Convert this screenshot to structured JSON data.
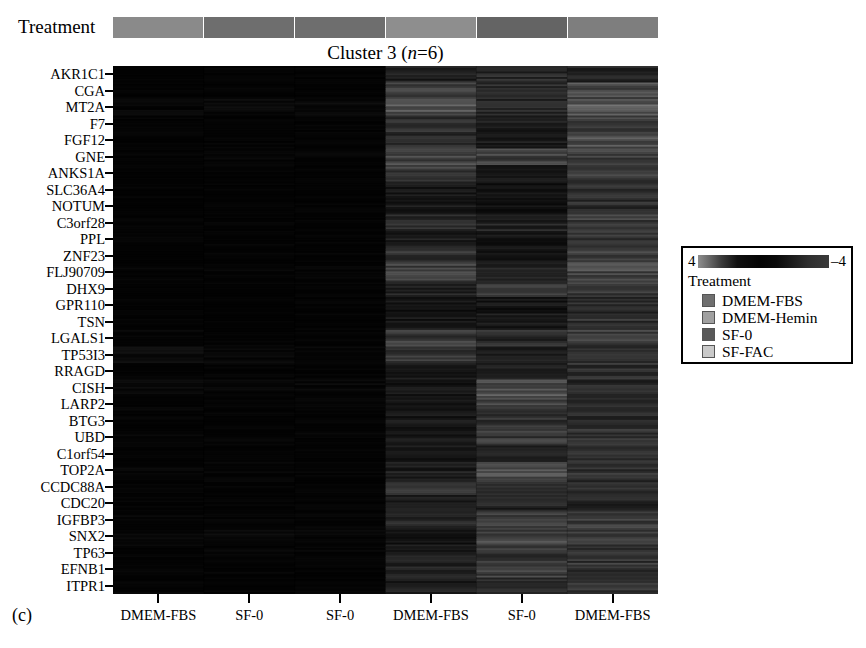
{
  "figure": {
    "panel_letter": "(c)",
    "title_prefix": "Cluster 3 (",
    "title_italic": "n",
    "title_suffix": "=6)",
    "treatment_axis_label": "Treatment"
  },
  "legend": {
    "heading": "Treatment",
    "scale_max": "4",
    "scale_min": "–4",
    "colorbar_colors": [
      "#8e8e8e",
      "#3a3a3a",
      "#040404",
      "#1c1c1c",
      "#3a3a3a"
    ],
    "items": [
      {
        "label": "DMEM-FBS",
        "color": "#6f6f6f"
      },
      {
        "label": "DMEM-Hemin",
        "color": "#a0a0a0"
      },
      {
        "label": "SF-0",
        "color": "#595959"
      },
      {
        "label": "SF-FAC",
        "color": "#c9c9c9"
      }
    ]
  },
  "treatment_strip": {
    "segments": [
      {
        "label": "DMEM-FBS",
        "color": "#8a8a8a"
      },
      {
        "label": "SF-0",
        "color": "#6e6e6e"
      },
      {
        "label": "SF-0",
        "color": "#6e6e6e"
      },
      {
        "label": "DMEM-FBS",
        "color": "#8e8e8e"
      },
      {
        "label": "SF-0",
        "color": "#646464"
      },
      {
        "label": "DMEM-FBS",
        "color": "#7e7e7e"
      }
    ]
  },
  "columns": {
    "labels": [
      "DMEM-FBS",
      "SF-0",
      "SF-0",
      "DMEM-FBS",
      "SF-0",
      "DMEM-FBS"
    ],
    "count": 6
  },
  "rows": {
    "genes": [
      "AKR1C1",
      "CGA",
      "MT2A",
      "F7",
      "FGF12",
      "GNE",
      "ANKS1A",
      "SLC36A4",
      "NOTUM",
      "C3orf28",
      "PPL",
      "ZNF23",
      "FLJ90709",
      "DHX9",
      "GPR110",
      "TSN",
      "LGALS1",
      "TP53I3",
      "RRAGD",
      "CISH",
      "LARP2",
      "BTG3",
      "UBD",
      "C1orf54",
      "TOP2A",
      "CCDC88A",
      "CDC20",
      "IGFBP3",
      "SNX2",
      "TP63",
      "EFNB1",
      "ITPR1"
    ],
    "count": 32
  },
  "chart_data": {
    "type": "heatmap",
    "title": "Cluster 3 (n=6)",
    "xlabel": "",
    "ylabel": "",
    "zlim": [
      -4,
      4
    ],
    "colormap": "grayscale-dark",
    "grid": false,
    "legend_position": "right",
    "x_categories": [
      "DMEM-FBS",
      "SF-0",
      "SF-0",
      "DMEM-FBS",
      "SF-0",
      "DMEM-FBS"
    ],
    "y_categories": [
      "AKR1C1",
      "CGA",
      "MT2A",
      "F7",
      "FGF12",
      "GNE",
      "ANKS1A",
      "SLC36A4",
      "NOTUM",
      "C3orf28",
      "PPL",
      "ZNF23",
      "FLJ90709",
      "DHX9",
      "GPR110",
      "TSN",
      "LGALS1",
      "TP53I3",
      "RRAGD",
      "CISH",
      "LARP2",
      "BTG3",
      "UBD",
      "C1orf54",
      "TOP2A",
      "CCDC88A",
      "CDC20",
      "IGFBP3",
      "SNX2",
      "TP63",
      "EFNB1",
      "ITPR1"
    ],
    "values": [
      [
        -3.2,
        -3.4,
        -3.3,
        -0.4,
        0.2,
        -0.1
      ],
      [
        -3.3,
        -3.3,
        -3.2,
        1.1,
        0.4,
        1.6
      ],
      [
        -2.6,
        -2.2,
        -2.4,
        1.9,
        0.1,
        2.2
      ],
      [
        -3.3,
        -3.3,
        -3.3,
        0.5,
        -0.6,
        1.1
      ],
      [
        -3.2,
        -3.1,
        -3.0,
        0.3,
        -0.5,
        1.8
      ],
      [
        -3.1,
        -2.8,
        -3.0,
        1.4,
        1.2,
        1.3
      ],
      [
        -3.3,
        -3.4,
        -3.3,
        1.0,
        -1.2,
        0.9
      ],
      [
        -3.4,
        -3.4,
        -3.4,
        -1.0,
        -1.4,
        0.6
      ],
      [
        -3.4,
        -3.4,
        -3.4,
        -0.8,
        -1.6,
        0.4
      ],
      [
        -3.3,
        -3.3,
        -3.3,
        0.1,
        -0.2,
        1.0
      ],
      [
        -3.3,
        -3.3,
        -3.3,
        -0.6,
        -1.0,
        0.8
      ],
      [
        -3.2,
        -3.2,
        -3.2,
        0.7,
        -0.9,
        1.2
      ],
      [
        -3.1,
        -3.0,
        -3.1,
        1.3,
        -0.4,
        1.5
      ],
      [
        -3.3,
        -3.3,
        -3.3,
        -0.3,
        0.6,
        0.9
      ],
      [
        -3.4,
        -3.4,
        -3.4,
        -1.2,
        -1.1,
        0.2
      ],
      [
        -3.3,
        -3.3,
        -3.3,
        -0.9,
        -0.8,
        0.5
      ],
      [
        -2.9,
        -3.1,
        -3.2,
        0.9,
        0.3,
        1.0
      ],
      [
        -1.6,
        -2.6,
        -2.8,
        0.6,
        -0.7,
        0.7
      ],
      [
        -3.2,
        -3.2,
        -3.2,
        -0.5,
        -0.3,
        0.4
      ],
      [
        -2.4,
        -2.3,
        -2.5,
        -1.1,
        1.7,
        0.3
      ],
      [
        -3.0,
        -2.9,
        -3.0,
        -0.7,
        1.1,
        0.6
      ],
      [
        -3.2,
        -3.2,
        -3.2,
        -0.9,
        0.4,
        0.2
      ],
      [
        -2.7,
        -2.8,
        -2.9,
        -0.6,
        0.9,
        0.8
      ],
      [
        -3.3,
        -3.3,
        -3.3,
        -1.0,
        0.1,
        0.3
      ],
      [
        -2.8,
        -2.7,
        -2.9,
        -0.4,
        1.5,
        0.5
      ],
      [
        -3.2,
        -3.2,
        -3.2,
        0.8,
        0.7,
        0.4
      ],
      [
        -3.3,
        -3.3,
        -3.3,
        -0.8,
        -0.2,
        0.1
      ],
      [
        -2.9,
        -3.0,
        -3.0,
        0.2,
        1.0,
        0.9
      ],
      [
        -2.5,
        -2.4,
        -2.6,
        -1.3,
        1.4,
        1.1
      ],
      [
        -2.9,
        -2.8,
        -3.0,
        -0.5,
        0.8,
        0.6
      ],
      [
        -3.0,
        -3.1,
        -3.1,
        -0.2,
        1.2,
        0.7
      ],
      [
        -3.1,
        -3.2,
        -3.2,
        -0.6,
        0.5,
        0.4
      ]
    ]
  }
}
